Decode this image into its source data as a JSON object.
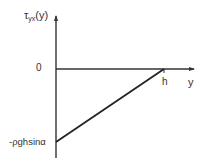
{
  "diagram": {
    "type": "shear-stress-profile",
    "y_axis_label_main": "τ",
    "y_axis_label_sub": "yx",
    "y_axis_label_tail": "(y)",
    "x_axis_label": "y",
    "origin_label": "0",
    "h_label": "h",
    "min_value_label": "-ρghsinα",
    "line_color": "#333333",
    "background": "#ffffff",
    "line": {
      "from": {
        "y": 0,
        "tau": "-ρghsinα"
      },
      "to": {
        "y": "h",
        "tau": 0
      }
    }
  }
}
